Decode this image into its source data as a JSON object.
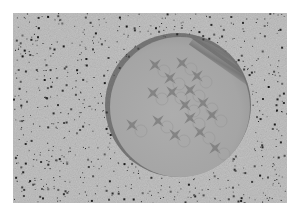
{
  "image": {
    "description": "Grayscale photograph of a circular gray disc bearing a pattern of four-pointed star shapes, resting on a speckled granite-like surface",
    "background_color": "#ffffff",
    "surface_color": "#b4b4b4",
    "disc_color": "#a8a8a8",
    "star_color": "#7a7a7a",
    "speckle_color": "#2a2a2a",
    "star_count": 16
  }
}
